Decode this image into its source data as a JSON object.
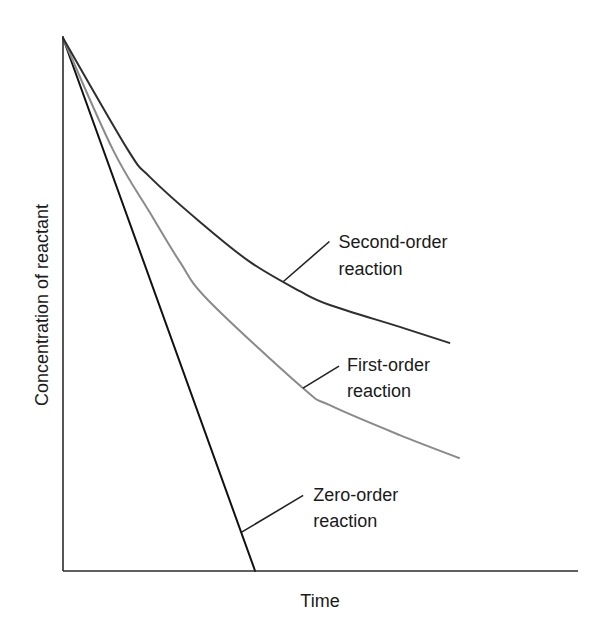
{
  "chart_data": {
    "type": "line",
    "title": "",
    "xlabel": "Time",
    "ylabel": "Concentration of reactant",
    "xlim": [
      0,
      10
    ],
    "ylim": [
      0,
      1
    ],
    "grid": false,
    "ticks": "none",
    "legend": "none (inline annotations)",
    "series": [
      {
        "name": "Zero-order reaction",
        "label_lines": [
          "Zero-order",
          "reaction"
        ],
        "color": "#111111",
        "x": [
          0,
          3.73
        ],
        "y": [
          1.0,
          0.0
        ]
      },
      {
        "name": "First-order reaction",
        "label_lines": [
          "First-order",
          "reaction"
        ],
        "color": "#8a8a8a",
        "x": [
          0,
          0.97,
          1.69,
          2.27,
          2.82,
          4.66,
          5.18,
          6.54,
          7.69
        ],
        "y": [
          1.0,
          0.79,
          0.672,
          0.58,
          0.508,
          0.343,
          0.311,
          0.255,
          0.212
        ]
      },
      {
        "name": "Second-order reaction",
        "label_lines": [
          "Second-order",
          "reaction"
        ],
        "color": "#2e2e2e",
        "x": [
          0,
          1.26,
          1.69,
          2.66,
          3.63,
          4.6,
          5.18,
          6.54,
          7.5
        ],
        "y": [
          1.0,
          0.79,
          0.739,
          0.655,
          0.58,
          0.525,
          0.499,
          0.458,
          0.428
        ]
      }
    ],
    "annotations": [
      {
        "text": "Second-order reaction",
        "series": "Second-order reaction",
        "at_x": 4.28
      },
      {
        "text": "First-order reaction",
        "series": "First-order reaction",
        "at_x": 4.66
      },
      {
        "text": "Zero-order reaction",
        "series": "Zero-order reaction",
        "at_x": 3.46
      }
    ]
  }
}
